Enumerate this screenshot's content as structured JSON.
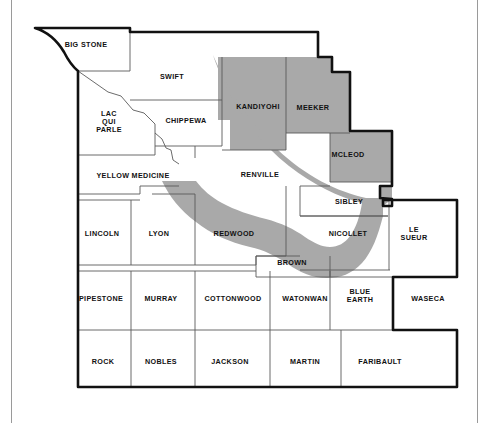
{
  "map": {
    "title": "Minnesota River Valley Counties Map",
    "region_name": "Southern Minnesota counties",
    "colors": {
      "shaded_fill": "#a9a9a9",
      "unshaded_fill": "#ffffff",
      "county_line": "#5a5a5a",
      "outer_boundary": "#111111",
      "frame_line": "#9a9a9a",
      "label_text": "#111111"
    },
    "legend_note": "",
    "shaded_counties": [
      "KANDIYOHI",
      "MEEKER",
      "MCLEOD"
    ],
    "river_band_label": "Minnesota River Valley corridor",
    "counties": [
      {
        "name": "BIG STONE",
        "x": 86,
        "y": 45,
        "shaded": false,
        "lines": [
          "BIG STONE"
        ]
      },
      {
        "name": "SWIFT",
        "x": 172,
        "y": 77,
        "shaded": false,
        "lines": [
          "SWIFT"
        ]
      },
      {
        "name": "LAC QUI PARLE",
        "x": 109,
        "y": 122,
        "shaded": false,
        "lines": [
          "LAC",
          "QUI",
          "PARLE"
        ]
      },
      {
        "name": "CHIPPEWA",
        "x": 186,
        "y": 121,
        "shaded": false,
        "lines": [
          "CHIPPEWA"
        ]
      },
      {
        "name": "KANDIYOHI",
        "x": 258,
        "y": 107,
        "shaded": true,
        "lines": [
          "KANDIYOHI"
        ]
      },
      {
        "name": "MEEKER",
        "x": 313,
        "y": 108,
        "shaded": true,
        "lines": [
          "MEEKER"
        ]
      },
      {
        "name": "MCLEOD",
        "x": 348,
        "y": 155,
        "shaded": true,
        "lines": [
          "MCLEOD"
        ]
      },
      {
        "name": "YELLOW MEDICINE",
        "x": 133,
        "y": 176,
        "shaded": false,
        "lines": [
          "YELLOW MEDICINE"
        ]
      },
      {
        "name": "RENVILLE",
        "x": 260,
        "y": 175,
        "shaded": false,
        "lines": [
          "RENVILLE"
        ]
      },
      {
        "name": "SIBLEY",
        "x": 349,
        "y": 202,
        "shaded": false,
        "lines": [
          "SIBLEY"
        ]
      },
      {
        "name": "LINCOLN",
        "x": 102,
        "y": 234,
        "shaded": false,
        "lines": [
          "LINCOLN"
        ]
      },
      {
        "name": "LYON",
        "x": 159,
        "y": 234,
        "shaded": false,
        "lines": [
          "LYON"
        ]
      },
      {
        "name": "REDWOOD",
        "x": 234,
        "y": 234,
        "shaded": false,
        "lines": [
          "REDWOOD"
        ]
      },
      {
        "name": "NICOLLET",
        "x": 348,
        "y": 234,
        "shaded": false,
        "lines": [
          "NICOLLET"
        ]
      },
      {
        "name": "LE SUEUR",
        "x": 414,
        "y": 234,
        "shaded": false,
        "lines": [
          "LE",
          "SUEUR"
        ]
      },
      {
        "name": "BROWN",
        "x": 292,
        "y": 263,
        "shaded": false,
        "lines": [
          "BROWN"
        ]
      },
      {
        "name": "PIPESTONE",
        "x": 101,
        "y": 299,
        "shaded": false,
        "lines": [
          "PIPESTONE"
        ]
      },
      {
        "name": "MURRAY",
        "x": 161,
        "y": 299,
        "shaded": false,
        "lines": [
          "MURRAY"
        ]
      },
      {
        "name": "COTTONWOOD",
        "x": 233,
        "y": 299,
        "shaded": false,
        "lines": [
          "COTTONWOOD"
        ]
      },
      {
        "name": "WATONWAN",
        "x": 305,
        "y": 299,
        "shaded": false,
        "lines": [
          "WATONWAN"
        ]
      },
      {
        "name": "BLUE EARTH",
        "x": 360,
        "y": 296,
        "shaded": false,
        "lines": [
          "BLUE",
          "EARTH"
        ]
      },
      {
        "name": "WASECA",
        "x": 428,
        "y": 299,
        "shaded": false,
        "lines": [
          "WASECA"
        ]
      },
      {
        "name": "ROCK",
        "x": 103,
        "y": 362,
        "shaded": false,
        "lines": [
          "ROCK"
        ]
      },
      {
        "name": "NOBLES",
        "x": 161,
        "y": 362,
        "shaded": false,
        "lines": [
          "NOBLES"
        ]
      },
      {
        "name": "JACKSON",
        "x": 230,
        "y": 362,
        "shaded": false,
        "lines": [
          "JACKSON"
        ]
      },
      {
        "name": "MARTIN",
        "x": 305,
        "y": 362,
        "shaded": false,
        "lines": [
          "MARTIN"
        ]
      },
      {
        "name": "FARIBAULT",
        "x": 380,
        "y": 362,
        "shaded": false,
        "lines": [
          "FARIBAULT"
        ]
      }
    ]
  }
}
